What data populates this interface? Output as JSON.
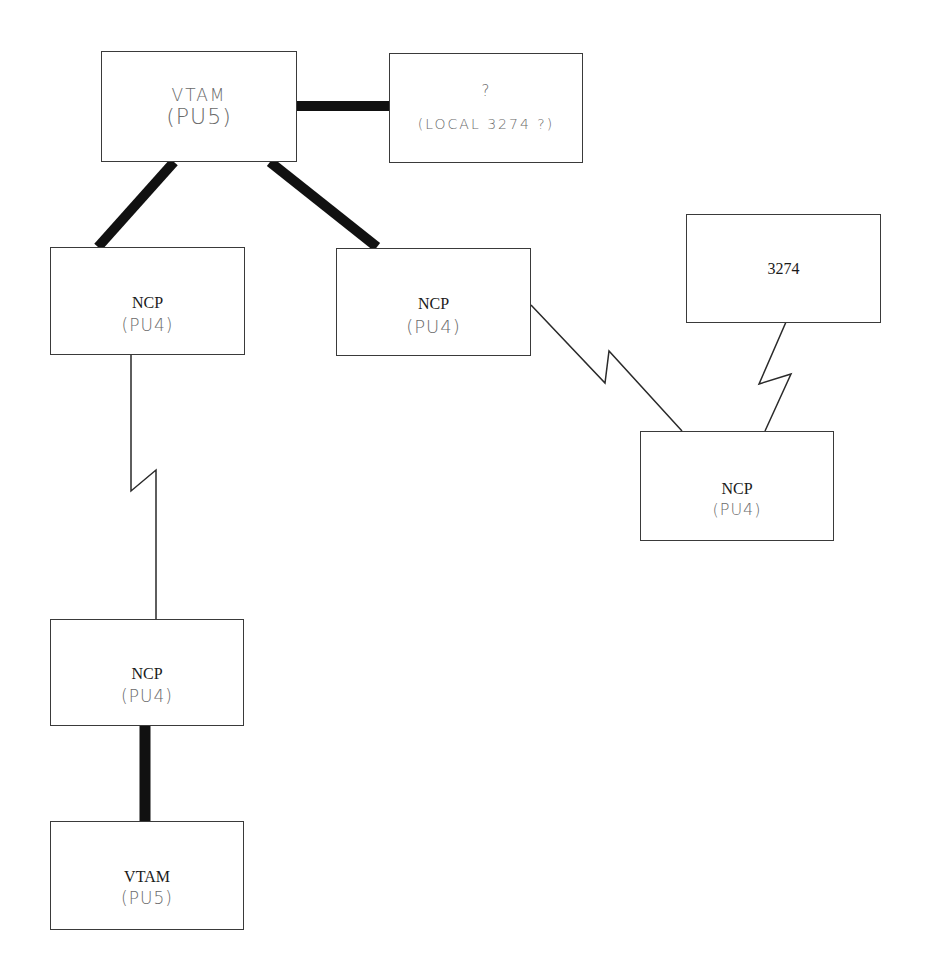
{
  "diagram": {
    "type": "network-topology",
    "nodes": [
      {
        "id": "vtam-top",
        "title": "VTAM",
        "subtitle": "(PU5)",
        "title_style": "handwritten"
      },
      {
        "id": "unknown",
        "title": "?",
        "subtitle": "(LOCAL 3274 ?)",
        "title_style": "handwritten"
      },
      {
        "id": "ncp-left",
        "title": "NCP",
        "subtitle": "(PU4)"
      },
      {
        "id": "ncp-middle",
        "title": "NCP",
        "subtitle": "(PU4)"
      },
      {
        "id": "terminal-3274",
        "title": "3274",
        "subtitle": ""
      },
      {
        "id": "ncp-right",
        "title": "NCP",
        "subtitle": "(PU4)"
      },
      {
        "id": "ncp-lower",
        "title": "NCP",
        "subtitle": "(PU4)"
      },
      {
        "id": "vtam-bottom",
        "title": "VTAM",
        "subtitle": "(PU5)"
      }
    ],
    "edges": [
      {
        "from": "vtam-top",
        "to": "unknown",
        "style": "thick-channel"
      },
      {
        "from": "vtam-top",
        "to": "ncp-left",
        "style": "thick-channel"
      },
      {
        "from": "vtam-top",
        "to": "ncp-middle",
        "style": "thick-channel"
      },
      {
        "from": "ncp-middle",
        "to": "ncp-right",
        "style": "telecom-link-zigzag"
      },
      {
        "from": "terminal-3274",
        "to": "ncp-right",
        "style": "telecom-link-zigzag"
      },
      {
        "from": "ncp-left",
        "to": "ncp-lower",
        "style": "telecom-link-zigzag"
      },
      {
        "from": "ncp-lower",
        "to": "vtam-bottom",
        "style": "thick-channel"
      }
    ],
    "colors": {
      "box_border": "#3a3a3a",
      "thick_line": "#111111",
      "thin_line": "#2a2a2a",
      "handwriting": "#6a6a6a",
      "printed_text": "#1a1a1a"
    }
  }
}
